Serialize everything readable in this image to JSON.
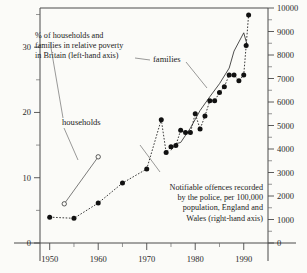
{
  "chart_data": {
    "type": "line",
    "title": "",
    "xlabel": "",
    "ylabel_left": "% of households and families in relative poverty in Britain (left-hand axis)",
    "ylabel_right": "Notifiable offences recorded by the police, per 100,000 population, England and Wales (right-hand axis)",
    "xlim": [
      1948,
      1995
    ],
    "ylim_left": [
      0,
      36
    ],
    "ylim_right": [
      0,
      10000
    ],
    "grid": false,
    "legend": "inline-annotations",
    "x_ticks_major": [
      1950,
      1960,
      1970,
      1980,
      1990
    ],
    "x_ticks_minor": [
      1955,
      1965,
      1975,
      1985
    ],
    "y_ticks_left_major": [
      0,
      10,
      20,
      30
    ],
    "y_ticks_left_minor": [
      5,
      15,
      25,
      35
    ],
    "y_ticks_right_major": [
      0,
      1000,
      2000,
      3000,
      4000,
      5000,
      6000,
      7000,
      8000,
      9000,
      10000
    ],
    "series": [
      {
        "name": "Notifiable offences recorded by the police",
        "axis": "right",
        "style": "dotted-line-with-filled-circles",
        "points": [
          {
            "x": 1950,
            "y": 1100
          },
          {
            "x": 1955,
            "y": 1050
          },
          {
            "x": 1960,
            "y": 1700
          },
          {
            "x": 1965,
            "y": 2550
          },
          {
            "x": 1970,
            "y": 3150
          },
          {
            "x": 1973,
            "y": 5250
          },
          {
            "x": 1974,
            "y": 3850
          },
          {
            "x": 1975,
            "y": 4100
          },
          {
            "x": 1976,
            "y": 4150
          },
          {
            "x": 1977,
            "y": 4800
          },
          {
            "x": 1978,
            "y": 4700
          },
          {
            "x": 1979,
            "y": 4700
          },
          {
            "x": 1980,
            "y": 5500
          },
          {
            "x": 1981,
            "y": 4850
          },
          {
            "x": 1982,
            "y": 5400
          },
          {
            "x": 1983,
            "y": 6050
          },
          {
            "x": 1984,
            "y": 6050
          },
          {
            "x": 1985,
            "y": 6400
          },
          {
            "x": 1986,
            "y": 6650
          },
          {
            "x": 1987,
            "y": 7150
          },
          {
            "x": 1988,
            "y": 7150
          },
          {
            "x": 1989,
            "y": 6900
          },
          {
            "x": 1990,
            "y": 7150
          },
          {
            "x": 1990.5,
            "y": 8400
          },
          {
            "x": 1991,
            "y": 9700
          }
        ]
      },
      {
        "name": "families",
        "axis": "left",
        "style": "solid-line",
        "points": [
          {
            "x": 1975,
            "y": 14.2
          },
          {
            "x": 1976,
            "y": 15.2
          },
          {
            "x": 1977,
            "y": 15.4
          },
          {
            "x": 1979,
            "y": 17.6
          },
          {
            "x": 1981,
            "y": 20.3
          },
          {
            "x": 1983,
            "y": 22.4
          },
          {
            "x": 1985,
            "y": 24.4
          },
          {
            "x": 1987,
            "y": 26.8
          },
          {
            "x": 1988,
            "y": 29.4
          },
          {
            "x": 1990,
            "y": 32.2
          },
          {
            "x": 1990.6,
            "y": 30.6
          }
        ]
      },
      {
        "name": "households",
        "axis": "left",
        "style": "solid-line-with-open-circles",
        "points": [
          {
            "x": 1953,
            "y": 6.0
          },
          {
            "x": 1960,
            "y": 13.2
          }
        ]
      }
    ],
    "annotations": [
      {
        "id": "poverty-note",
        "lines": [
          "% of households and",
          "families in relative poverty",
          "in Britain (left-hand axis)"
        ]
      },
      {
        "id": "crime-note",
        "lines": [
          "Notifiable offences recorded",
          "by the police, per 100,000",
          "population, England and",
          "Wales (right-hand axis)"
        ]
      },
      {
        "id": "families-label",
        "lines": [
          "families"
        ]
      },
      {
        "id": "households-label",
        "lines": [
          "households"
        ]
      }
    ]
  },
  "axes": {
    "left_tick_labels": [
      "0",
      "10",
      "20",
      "30"
    ],
    "right_tick_labels": [
      "0",
      "1000",
      "2000",
      "3000",
      "4000",
      "5000",
      "6000",
      "7000",
      "8000",
      "9000",
      "10000"
    ],
    "x_tick_labels": [
      "1950",
      "1960",
      "1970",
      "1980",
      "1990"
    ]
  },
  "colors": {
    "background": "#fbfbf8",
    "ink": "#1b1b1b",
    "axis": "#4a4a4a",
    "marker": "#111111"
  }
}
